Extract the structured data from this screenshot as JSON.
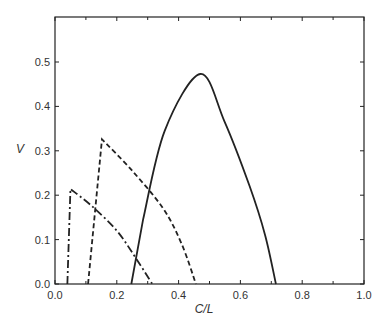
{
  "chart_data": {
    "type": "line",
    "title": "",
    "xlabel": "C/L",
    "ylabel": "V",
    "xlim": [
      0.0,
      1.0
    ],
    "ylim": [
      0.0,
      0.6
    ],
    "grid": false,
    "legend": null,
    "x_ticks": [
      "0.0",
      "0.2",
      "0.4",
      "0.6",
      "0.8",
      "1.0"
    ],
    "y_ticks": [
      "0.0",
      "0.1",
      "0.2",
      "0.3",
      "0.4",
      "0.5"
    ],
    "series": [
      {
        "name": "dash-dot",
        "style": "dashdot",
        "points": [
          [
            0.04,
            0.0
          ],
          [
            0.05,
            0.214
          ],
          [
            0.12,
            0.175
          ],
          [
            0.2,
            0.12
          ],
          [
            0.26,
            0.06
          ],
          [
            0.315,
            0.0
          ]
        ]
      },
      {
        "name": "dashed",
        "style": "dashed",
        "points": [
          [
            0.107,
            0.0
          ],
          [
            0.152,
            0.326
          ],
          [
            0.25,
            0.255
          ],
          [
            0.35,
            0.17
          ],
          [
            0.41,
            0.09
          ],
          [
            0.456,
            0.0
          ]
        ]
      },
      {
        "name": "solid",
        "style": "solid",
        "points": [
          [
            0.247,
            0.0
          ],
          [
            0.285,
            0.145
          ],
          [
            0.355,
            0.345
          ],
          [
            0.47,
            0.473
          ],
          [
            0.548,
            0.367
          ],
          [
            0.63,
            0.22
          ],
          [
            0.68,
            0.11
          ],
          [
            0.715,
            0.0
          ]
        ]
      }
    ]
  }
}
